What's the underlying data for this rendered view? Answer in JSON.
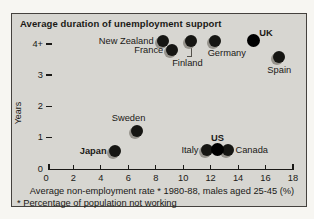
{
  "panel": {
    "background": "#d7d6d1",
    "border_color": "#45423e",
    "dot_color": "#161613",
    "dot_black": "#000000",
    "halo_color": "#96938c",
    "text_color": "#1a1916"
  },
  "chart_data": {
    "type": "scatter",
    "title": "Average duration of unemployment support",
    "xlabel": "Average non-employment rate * 1980-88, males aged 25-45 (%)",
    "ylabel": "Years",
    "footnote": "* Percentage of population not working",
    "xlim": [
      0,
      18
    ],
    "ylim": [
      0,
      4.5
    ],
    "x_ticks": [
      0,
      2,
      4,
      6,
      8,
      10,
      12,
      14,
      16,
      18
    ],
    "y_ticks": [
      {
        "value": 0,
        "label": "0"
      },
      {
        "value": 1,
        "label": "1"
      },
      {
        "value": 2,
        "label": "2"
      },
      {
        "value": 3,
        "label": "3"
      },
      {
        "value": 4,
        "label": "4+"
      }
    ],
    "y_axis_note": "values of 4 years or more shown at 4+",
    "grid": false,
    "points": [
      {
        "name": "New Zealand",
        "x": 8.5,
        "y": 4.1,
        "bold": false,
        "black": false,
        "anchor": "end",
        "dx": -9,
        "dy": 0
      },
      {
        "name": "France",
        "x": 9.2,
        "y": 3.8,
        "bold": false,
        "black": false,
        "anchor": "end",
        "dx": -9,
        "dy": 0
      },
      {
        "name": "Finland",
        "x": 10.6,
        "y": 4.1,
        "bold": false,
        "black": false,
        "anchor": "middle",
        "dx": -4,
        "dy": 22,
        "connector": true
      },
      {
        "name": "Germany",
        "x": 12.3,
        "y": 4.1,
        "bold": false,
        "black": false,
        "anchor": "middle",
        "dx": 12,
        "dy": 12
      },
      {
        "name": "UK",
        "x": 15.1,
        "y": 4.1,
        "bold": true,
        "black": true,
        "anchor": "start",
        "dx": 6,
        "dy": -8
      },
      {
        "name": "Spain",
        "x": 17.0,
        "y": 3.6,
        "bold": false,
        "black": false,
        "anchor": "middle",
        "dx": 0,
        "dy": 13
      },
      {
        "name": "Sweden",
        "x": 6.6,
        "y": 1.2,
        "bold": false,
        "black": false,
        "anchor": "middle",
        "dx": -8,
        "dy": -13
      },
      {
        "name": "Japan",
        "x": 5.0,
        "y": 0.55,
        "bold": true,
        "black": false,
        "anchor": "end",
        "dx": -8,
        "dy": 0
      },
      {
        "name": "Italy",
        "x": 11.7,
        "y": 0.6,
        "bold": false,
        "black": false,
        "anchor": "end",
        "dx": -8,
        "dy": 0
      },
      {
        "name": "Canada",
        "x": 13.3,
        "y": 0.6,
        "bold": false,
        "black": false,
        "anchor": "start",
        "dx": 7,
        "dy": 0
      },
      {
        "name": "US",
        "x": 12.5,
        "y": 0.6,
        "bold": true,
        "black": true,
        "anchor": "middle",
        "dx": 0,
        "dy": -12
      }
    ]
  }
}
